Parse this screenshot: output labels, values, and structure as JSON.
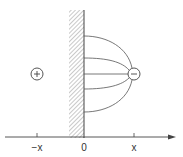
{
  "diagram": {
    "colors": {
      "stroke": "#444444",
      "hatch": "#777777",
      "background": "#ffffff"
    },
    "axis": {
      "tick_labels": [
        "−x",
        "0",
        "x"
      ]
    },
    "charges": [
      {
        "name": "positive-image-charge",
        "symbol": "+",
        "position_label": "−x"
      },
      {
        "name": "negative-real-charge",
        "symbol": "−",
        "position_label": "x"
      }
    ],
    "wall": {
      "type": "conducting-plane",
      "position_label": "0"
    },
    "field_lines_count": 5
  }
}
